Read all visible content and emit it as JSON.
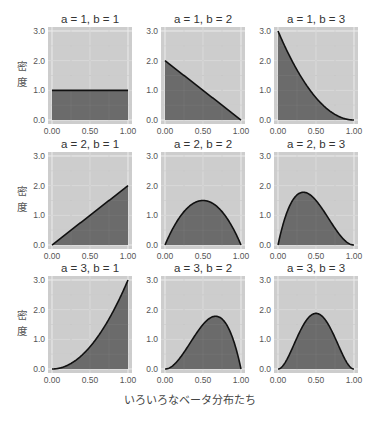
{
  "chart_data": {
    "type": "area",
    "title": "",
    "xlabel": "いろいろなベータ分布たち",
    "ylabel": "密度",
    "xlim": [
      0,
      1
    ],
    "ylim": [
      0,
      3
    ],
    "x_ticks": [
      "0.00",
      "0.50",
      "1.00"
    ],
    "y_ticks": [
      "0.0",
      "1.0",
      "2.0",
      "3.0"
    ],
    "grid": true,
    "legend": null,
    "colors": {
      "panel_background": "#cdcdcd",
      "grid": "#ececec",
      "fill": "#6b6b6b",
      "line": "#111111"
    },
    "layout": {
      "rows": 3,
      "cols": 3,
      "facet": "a (rows) x b (cols)"
    },
    "panels": [
      {
        "title": "a = 1, b = 1",
        "a": 1,
        "b": 1,
        "x": [
          0,
          0.25,
          0.5,
          0.75,
          1.0
        ],
        "y": [
          1.0,
          1.0,
          1.0,
          1.0,
          1.0
        ]
      },
      {
        "title": "a = 1, b = 2",
        "a": 1,
        "b": 2,
        "x": [
          0,
          0.25,
          0.5,
          0.75,
          1.0
        ],
        "y": [
          2.0,
          1.5,
          1.0,
          0.5,
          0.0
        ]
      },
      {
        "title": "a = 1, b = 3",
        "a": 1,
        "b": 3,
        "x": [
          0,
          0.25,
          0.5,
          0.75,
          1.0
        ],
        "y": [
          3.0,
          1.69,
          0.75,
          0.19,
          0.0
        ]
      },
      {
        "title": "a = 2, b = 1",
        "a": 2,
        "b": 1,
        "x": [
          0,
          0.25,
          0.5,
          0.75,
          1.0
        ],
        "y": [
          0.0,
          0.5,
          1.0,
          1.5,
          2.0
        ]
      },
      {
        "title": "a = 2, b = 2",
        "a": 2,
        "b": 2,
        "x": [
          0,
          0.25,
          0.5,
          0.75,
          1.0
        ],
        "y": [
          0.0,
          1.125,
          1.5,
          1.125,
          0.0
        ]
      },
      {
        "title": "a = 2, b = 3",
        "a": 2,
        "b": 3,
        "x": [
          0,
          0.25,
          0.333,
          0.5,
          0.75,
          1.0
        ],
        "y": [
          0.0,
          1.69,
          1.78,
          1.5,
          0.56,
          0.0
        ]
      },
      {
        "title": "a = 3, b = 1",
        "a": 3,
        "b": 1,
        "x": [
          0,
          0.25,
          0.5,
          0.75,
          1.0
        ],
        "y": [
          0.0,
          0.19,
          0.75,
          1.69,
          3.0
        ]
      },
      {
        "title": "a = 3, b = 2",
        "a": 3,
        "b": 2,
        "x": [
          0,
          0.25,
          0.5,
          0.667,
          0.75,
          1.0
        ],
        "y": [
          0.0,
          0.56,
          1.5,
          1.78,
          1.69,
          0.0
        ]
      },
      {
        "title": "a = 3, b = 3",
        "a": 3,
        "b": 3,
        "x": [
          0,
          0.25,
          0.5,
          0.75,
          1.0
        ],
        "y": [
          0.0,
          1.05,
          1.875,
          1.05,
          0.0
        ]
      }
    ]
  }
}
